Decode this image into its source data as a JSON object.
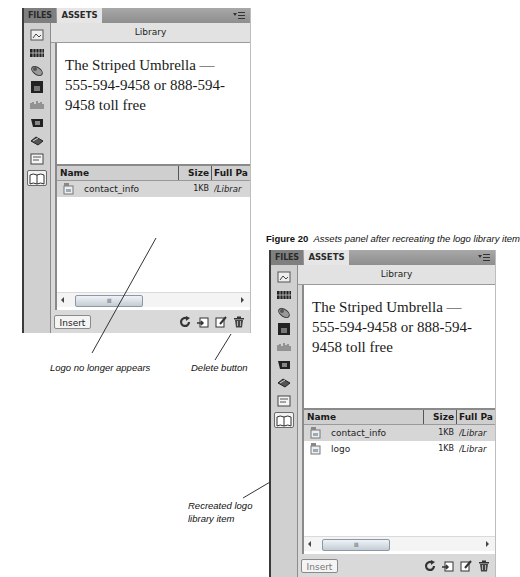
{
  "figure_caption": {
    "label": "Figure 20",
    "text": "Assets panel after recreating the logo library item"
  },
  "panels": [
    {
      "tabs": [
        {
          "label": "FILES"
        },
        {
          "label": "ASSETS",
          "active": true
        }
      ],
      "menu_icon": "panel-options-menu-icon",
      "category_title": "Library",
      "sidebar_icons": [
        "images-icon",
        "colors-icon",
        "urls-icon",
        "swf-icon",
        "shockwave-icon",
        "movies-icon",
        "scripts-icon",
        "templates-icon",
        "library-icon"
      ],
      "active_category": "library-icon",
      "preview_text": "The Striped Umbrella — 555-594-9458 or 888-594-9458 toll free",
      "columns": {
        "name": "Name",
        "size": "Size",
        "path": "Full Pa"
      },
      "items": [
        {
          "name": "contact_info",
          "size": "1KB",
          "path": "/Librar",
          "selected": true
        }
      ],
      "scroll_thumb": "III",
      "toolbar": {
        "insert_label": "Insert",
        "icons": [
          "refresh-icon",
          "new-library-item-icon",
          "edit-icon",
          "delete-icon"
        ]
      }
    },
    {
      "tabs": [
        {
          "label": "FILES"
        },
        {
          "label": "ASSETS",
          "active": true
        }
      ],
      "menu_icon": "panel-options-menu-icon",
      "category_title": "Library",
      "sidebar_icons": [
        "images-icon",
        "colors-icon",
        "urls-icon",
        "swf-icon",
        "shockwave-icon",
        "movies-icon",
        "scripts-icon",
        "templates-icon",
        "library-icon"
      ],
      "active_category": "library-icon",
      "preview_text": "The Striped Umbrella — 555-594-9458 or 888-594-9458 toll free",
      "columns": {
        "name": "Name",
        "size": "Size",
        "path": "Full Pa"
      },
      "items": [
        {
          "name": "contact_info",
          "size": "1KB",
          "path": "/Librar",
          "selected": true
        },
        {
          "name": "logo",
          "size": "1KB",
          "path": "/Librar",
          "selected": false
        }
      ],
      "scroll_thumb": "III",
      "toolbar": {
        "insert_label": "Insert",
        "icons": [
          "refresh-icon",
          "new-library-item-icon",
          "edit-icon",
          "delete-icon"
        ]
      }
    }
  ],
  "annotations": {
    "logo_gone": "Logo no longer appears",
    "delete_button": "Delete button",
    "recreated_line1": "Recreated logo",
    "recreated_line2": "library item"
  }
}
